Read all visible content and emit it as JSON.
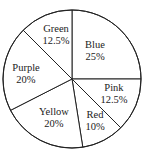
{
  "chart_data": {
    "type": "pie",
    "title": "",
    "categories": [
      "Blue",
      "Pink",
      "Red",
      "Yellow",
      "Purple",
      "Green"
    ],
    "values": [
      25,
      12.5,
      10,
      20,
      20,
      12.5
    ],
    "unit": "%",
    "start_angle": "12 o'clock",
    "direction": "clockwise",
    "legend": "none (labels inside slices)",
    "fill": "#ffffff",
    "stroke": "#222222",
    "slices": [
      {
        "label": "Blue",
        "value": 25,
        "text": "25%"
      },
      {
        "label": "Pink",
        "value": 12.5,
        "text": "12.5%"
      },
      {
        "label": "Red",
        "value": 10,
        "text": "10%"
      },
      {
        "label": "Yellow",
        "value": 20,
        "text": "20%"
      },
      {
        "label": "Purple",
        "value": 20,
        "text": "20%"
      },
      {
        "label": "Green",
        "value": 12.5,
        "text": "12.5%"
      }
    ]
  }
}
